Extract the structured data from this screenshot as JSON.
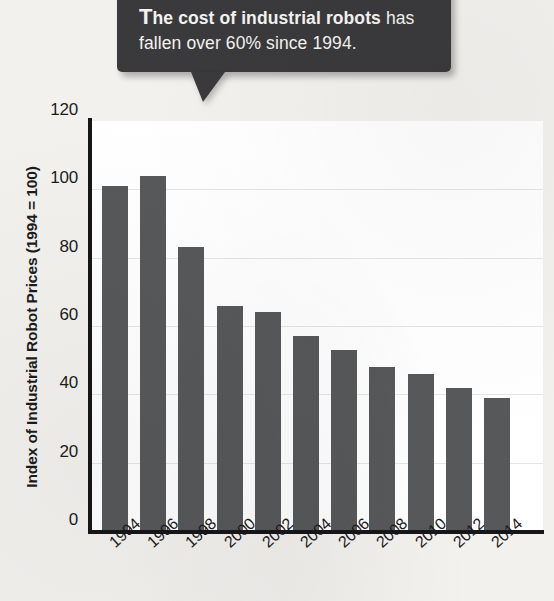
{
  "callout": {
    "dropcap": "T",
    "lead": "he cost of industrial robots",
    "rest": " has fallen over 60% since 1994.",
    "full_text": "The cost of industrial robots has fallen over 60% since 1994.",
    "background_color": "#3a3a3c",
    "text_color": "#f4f3f0"
  },
  "colors": {
    "page_background": "#f2f1ee",
    "plot_background": "#ffffff",
    "bar": "#57585a",
    "axis": "#16161a",
    "gridline": "#e6e6e2",
    "text": "#1c1c1c"
  },
  "chart_data": {
    "type": "bar",
    "title": "",
    "subtitle": "",
    "xlabel": "",
    "ylabel": "Index of Industrial Robot Prices (1994 = 100)",
    "categories": [
      "1994",
      "1996",
      "1998",
      "2000",
      "2002",
      "2004",
      "2006",
      "2008",
      "2010",
      "2012",
      "2014"
    ],
    "values": [
      101,
      104,
      83,
      66,
      64,
      57,
      53,
      48,
      46,
      42,
      39
    ],
    "ylim": [
      0,
      120
    ],
    "yticks": [
      0,
      20,
      40,
      60,
      80,
      100,
      120
    ],
    "ytick_labels": [
      "0",
      "20",
      "40",
      "60",
      "80",
      "100",
      "120"
    ],
    "grid": true,
    "grid_axis": "y",
    "legend": false,
    "legend_position": "none",
    "annotations": [
      {
        "text": "The cost of industrial robots has fallen over 60% since 1994.",
        "type": "callout",
        "points_to": "1994"
      }
    ]
  }
}
